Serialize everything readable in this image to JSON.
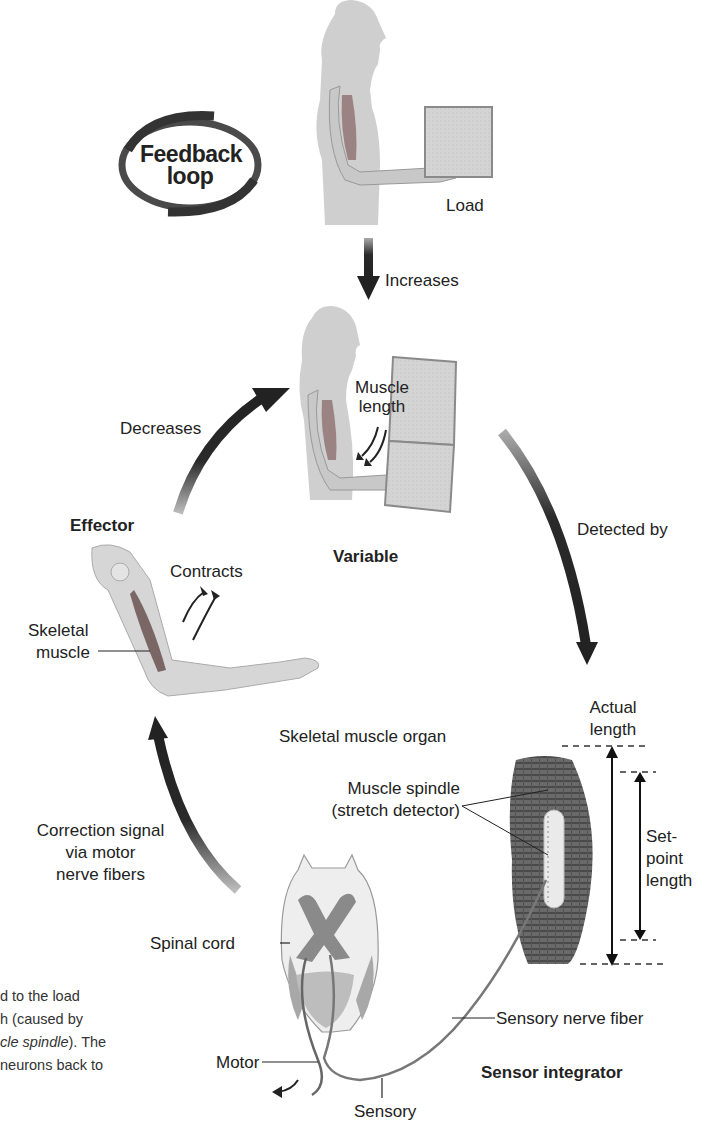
{
  "figure": {
    "badge": {
      "line1": "Feedback",
      "line2": "loop"
    },
    "top_scene": {
      "load_label": "Load"
    },
    "arrows": {
      "increases": "Increases",
      "decreases": "Decreases",
      "detected_by": "Detected by",
      "correction_line1": "Correction signal",
      "correction_line2": "via motor",
      "correction_line3": "nerve fibers"
    },
    "variable": {
      "title": "Variable",
      "muscle_length_line1": "Muscle",
      "muscle_length_line2": "length"
    },
    "effector": {
      "title": "Effector",
      "contracts": "Contracts",
      "skeletal_line1": "Skeletal",
      "skeletal_line2": "muscle"
    },
    "sensor": {
      "organ_label": "Skeletal muscle organ",
      "spindle_line1": "Muscle spindle",
      "spindle_line2": "(stretch detector)",
      "actual_line1": "Actual",
      "actual_line2": "length",
      "setpoint_line1": "Set-",
      "setpoint_line2": "point",
      "setpoint_line3": "length",
      "sensory_nerve_fiber": "Sensory nerve fiber",
      "title": "Sensor integrator"
    },
    "spinal": {
      "spinal_cord": "Spinal cord",
      "motor": "Motor",
      "sensory": "Sensory"
    },
    "caption_fragment": {
      "line1": "d to the load",
      "line2": "h (caused by",
      "line3_italic": "cle spindle",
      "line3_rest": "). The",
      "line4": "neurons back to"
    }
  }
}
